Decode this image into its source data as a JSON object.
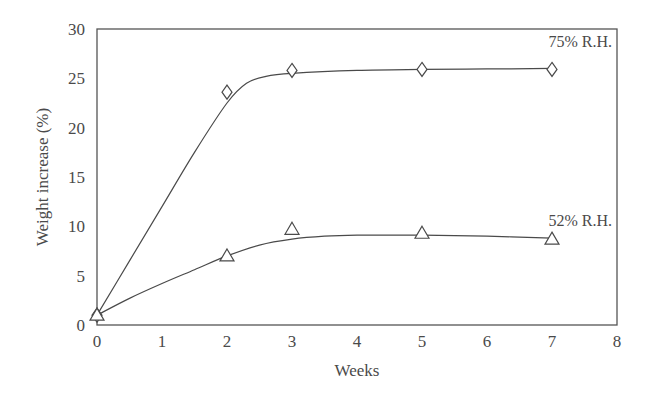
{
  "chart_data": {
    "type": "line",
    "title": "",
    "xlabel": "Weeks",
    "ylabel": "Weight increase (%)",
    "xlim": [
      0,
      8
    ],
    "ylim": [
      0,
      30
    ],
    "x_ticks": [
      0,
      1,
      2,
      3,
      4,
      5,
      6,
      7,
      8
    ],
    "y_ticks": [
      0,
      5,
      10,
      15,
      20,
      25,
      30
    ],
    "grid": false,
    "legend": "inline labels at right end of curves",
    "series": [
      {
        "name": "75% R.H.",
        "marker": "diamond",
        "x": [
          0,
          2,
          3,
          5,
          7
        ],
        "values": [
          1,
          23.6,
          25.8,
          25.9,
          25.9
        ],
        "fit_curve": [
          [
            0,
            1
          ],
          [
            0.5,
            6.5
          ],
          [
            1,
            12
          ],
          [
            1.5,
            17.5
          ],
          [
            2,
            22.5
          ],
          [
            2.3,
            24.5
          ],
          [
            2.6,
            25.2
          ],
          [
            3,
            25.5
          ],
          [
            4,
            25.8
          ],
          [
            5,
            25.9
          ],
          [
            6,
            25.95
          ],
          [
            7,
            26
          ]
        ]
      },
      {
        "name": "52% R.H.",
        "marker": "triangle",
        "x": [
          0,
          2,
          3,
          5,
          7
        ],
        "values": [
          1,
          7,
          9.7,
          9.3,
          8.7
        ],
        "fit_curve": [
          [
            0,
            1
          ],
          [
            0.5,
            2.7
          ],
          [
            1,
            4.2
          ],
          [
            1.5,
            5.6
          ],
          [
            2,
            7
          ],
          [
            2.5,
            8.1
          ],
          [
            3,
            8.7
          ],
          [
            3.5,
            9
          ],
          [
            4,
            9.1
          ],
          [
            5,
            9.1
          ],
          [
            6,
            9
          ],
          [
            7,
            8.8
          ]
        ]
      }
    ]
  },
  "labels": {
    "series_75": "75% R.H.",
    "series_52": "52% R.H.",
    "xlabel": "Weeks",
    "ylabel": "Weight increase (%)"
  },
  "colors": {
    "line": "#4a4a4a",
    "frame": "#555555",
    "text": "#4a4a4a"
  }
}
